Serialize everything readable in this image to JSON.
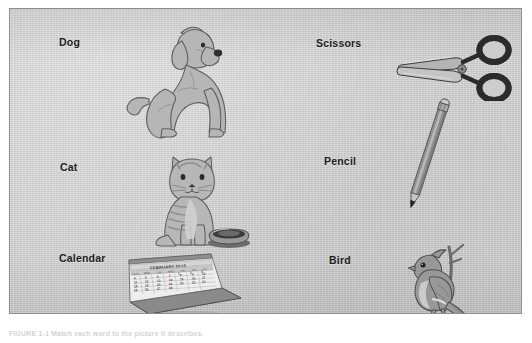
{
  "figure": {
    "kind": "scanned-textbook-figure",
    "caption": "FIGURE 1-1  Match each word to the picture it describes.",
    "background_color": "#cdcdcd",
    "border_color": "#8e8e8e",
    "page_color": "#ffffff",
    "ink_color": "#1d1d1d"
  },
  "columns": [
    {
      "name": "left-column",
      "items": [
        {
          "label": "Dog",
          "icon": "dog-illustration"
        },
        {
          "label": "Cat",
          "icon": "cat-illustration"
        },
        {
          "label": "Calendar",
          "icon": "calendar-illustration"
        }
      ]
    },
    {
      "name": "right-column",
      "items": [
        {
          "label": "Scissors",
          "icon": "scissors-illustration"
        },
        {
          "label": "Pencil",
          "icon": "pencil-illustration"
        },
        {
          "label": "Bird",
          "icon": "bird-illustration"
        }
      ]
    }
  ],
  "calendar": {
    "header": "FEBRUARY 2013",
    "weekday_headers": [
      "SUN",
      "MON",
      "TUE",
      "WED",
      "THU",
      "FRI",
      "SAT"
    ],
    "weeks": [
      [
        "",
        "",
        "",
        "",
        "1",
        "2",
        "3"
      ],
      [
        "4",
        "5",
        "6",
        "7",
        "8",
        "9",
        "10"
      ],
      [
        "11",
        "12",
        "13",
        "14",
        "15",
        "16",
        "17"
      ],
      [
        "18",
        "19",
        "20",
        "21",
        "22",
        "23",
        "24"
      ],
      [
        "25",
        "26",
        "27",
        "28",
        "",
        "",
        ""
      ]
    ]
  },
  "colors": {
    "scissors_handle": "#2b2b2b",
    "scissors_blade": "#a8a8a8",
    "pencil_body": "#8d8d8d",
    "pencil_tip": "#262626",
    "bird_body": "#8f8f8f",
    "animal_fill": "#b3b3b3",
    "animal_outline": "#555555"
  }
}
